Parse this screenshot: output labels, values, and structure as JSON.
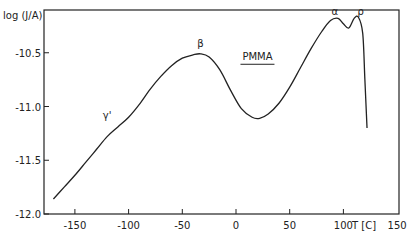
{
  "chart_data": {
    "type": "line",
    "title": "",
    "xlabel": "T [C]",
    "ylabel": "log (J/A)",
    "xlim": [
      -175,
      150
    ],
    "ylim": [
      -12.0,
      -10.1
    ],
    "grid": false,
    "legend": "none",
    "x_ticks": [
      -150,
      -100,
      -50,
      0,
      50,
      100,
      150
    ],
    "x_tick_labels": [
      "-150",
      "-100",
      "-50",
      "0",
      "50",
      "100",
      "150"
    ],
    "y_ticks": [
      -10.5,
      -11.0,
      -11.5,
      -12.0
    ],
    "y_tick_labels": [
      "-10.5",
      "-11.0",
      "-11.5",
      "-12.0"
    ],
    "series": [
      {
        "name": "PMMA",
        "x": [
          -170,
          -160,
          -150,
          -140,
          -130,
          -120,
          -110,
          -100,
          -90,
          -80,
          -70,
          -60,
          -50,
          -40,
          -33,
          -25,
          -15,
          -5,
          5,
          15,
          22,
          30,
          40,
          50,
          60,
          70,
          80,
          88,
          95,
          100,
          105,
          110,
          114,
          118,
          120,
          122
        ],
        "y": [
          -11.86,
          -11.75,
          -11.64,
          -11.52,
          -11.4,
          -11.28,
          -11.19,
          -11.1,
          -10.98,
          -10.84,
          -10.72,
          -10.62,
          -10.55,
          -10.52,
          -10.51,
          -10.54,
          -10.66,
          -10.85,
          -11.02,
          -11.1,
          -11.11,
          -11.07,
          -10.97,
          -10.82,
          -10.64,
          -10.46,
          -10.3,
          -10.2,
          -10.18,
          -10.23,
          -10.27,
          -10.18,
          -10.17,
          -10.32,
          -10.75,
          -11.2
        ]
      }
    ],
    "annotations": [
      {
        "text": "γ'",
        "x": -120,
        "y": -11.12
      },
      {
        "text": "β",
        "x": -33,
        "y": -10.45
      },
      {
        "text": "PMMA",
        "x": 20,
        "y": -10.57,
        "underline": true
      },
      {
        "text": "α",
        "x": 92,
        "y": -10.15
      },
      {
        "text": "ρ",
        "x": 116,
        "y": -10.15
      }
    ]
  }
}
